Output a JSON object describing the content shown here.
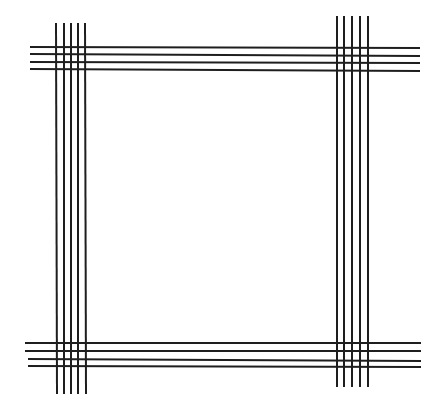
{
  "figure": {
    "stroke_color": "#1e1e1e",
    "stroke_width": 2,
    "background": "#ffffff",
    "bundles": {
      "top_horizontal": [
        {
          "x1": 30,
          "y1": 47,
          "x2": 420,
          "y2": 48
        },
        {
          "x1": 30,
          "y1": 54,
          "x2": 420,
          "y2": 56
        },
        {
          "x1": 30,
          "y1": 62,
          "x2": 420,
          "y2": 63
        },
        {
          "x1": 30,
          "y1": 69,
          "x2": 420,
          "y2": 71
        }
      ],
      "bottom_horizontal": [
        {
          "x1": 25,
          "y1": 343,
          "x2": 421,
          "y2": 343
        },
        {
          "x1": 25,
          "y1": 351,
          "x2": 421,
          "y2": 351
        },
        {
          "x1": 28,
          "y1": 359,
          "x2": 421,
          "y2": 361
        },
        {
          "x1": 28,
          "y1": 366,
          "x2": 421,
          "y2": 367
        }
      ],
      "left_vertical": [
        {
          "x1": 56,
          "y1": 23,
          "x2": 57,
          "y2": 394
        },
        {
          "x1": 64,
          "y1": 23,
          "x2": 64,
          "y2": 394
        },
        {
          "x1": 71,
          "y1": 23,
          "x2": 71,
          "y2": 394
        },
        {
          "x1": 78,
          "y1": 23,
          "x2": 78,
          "y2": 394
        },
        {
          "x1": 85,
          "y1": 23,
          "x2": 86,
          "y2": 394
        }
      ],
      "right_vertical": [
        {
          "x1": 337,
          "y1": 16,
          "x2": 337,
          "y2": 387
        },
        {
          "x1": 344,
          "y1": 16,
          "x2": 344,
          "y2": 387
        },
        {
          "x1": 352,
          "y1": 16,
          "x2": 352,
          "y2": 387
        },
        {
          "x1": 360,
          "y1": 16,
          "x2": 360,
          "y2": 387
        },
        {
          "x1": 368,
          "y1": 16,
          "x2": 368,
          "y2": 387
        }
      ]
    }
  }
}
